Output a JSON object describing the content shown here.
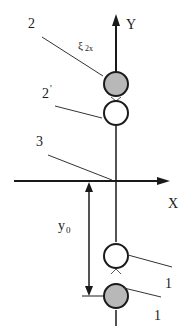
{
  "diagram": {
    "axes": {
      "y_label": "Y",
      "x_label": "X"
    },
    "labels": {
      "label_2": "2",
      "label_2prime": "2",
      "label_2prime_mark": "'",
      "label_3": "3",
      "label_xi": "ξ",
      "label_xi_sub": "2x",
      "label_y0": "y",
      "label_y0_sub": "0",
      "label_1_upper": "1",
      "label_1_lower": "1"
    },
    "colors": {
      "line": "#1a1a1a",
      "filled_circle": "#b8b8b8",
      "open_circle": "#ffffff"
    }
  }
}
